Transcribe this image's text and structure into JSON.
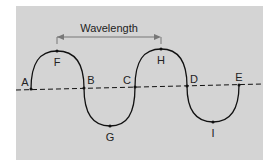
{
  "diagram": {
    "title": "Wavelength",
    "colors": {
      "panel": "#d4d4d4",
      "wave": "#111111",
      "axis": "#111111",
      "arrow": "#777777",
      "text": "#222222"
    },
    "points": [
      {
        "label": "A",
        "x": 31,
        "y": 89,
        "lx": 24,
        "ly": 82
      },
      {
        "label": "F",
        "x": 57,
        "y": 51,
        "lx": 57,
        "ly": 63
      },
      {
        "label": "B",
        "x": 84,
        "y": 88,
        "lx": 91,
        "ly": 82
      },
      {
        "label": "G",
        "x": 110,
        "y": 126,
        "lx": 110,
        "ly": 139
      },
      {
        "label": "C",
        "x": 135,
        "y": 87,
        "lx": 127,
        "ly": 81
      },
      {
        "label": "H",
        "x": 161,
        "y": 49,
        "lx": 161,
        "ly": 62
      },
      {
        "label": "D",
        "x": 187,
        "y": 86,
        "lx": 194,
        "ly": 80
      },
      {
        "label": "I",
        "x": 213,
        "y": 122,
        "lx": 213,
        "ly": 135
      },
      {
        "label": "E",
        "x": 239,
        "y": 85,
        "lx": 239,
        "ly": 78
      }
    ],
    "wavelength_span": {
      "from": "F",
      "to": "H"
    }
  }
}
